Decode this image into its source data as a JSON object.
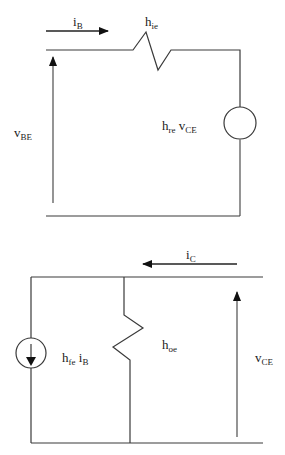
{
  "input_circuit": {
    "current_label": {
      "main": "i",
      "sub": "B"
    },
    "resistor_label": {
      "main": "h",
      "sub": "ie"
    },
    "voltage_label": {
      "main": "v",
      "sub": "BE"
    },
    "source_label": {
      "main1": "h",
      "sub1": "re",
      "main2": " v",
      "sub2": "CE"
    }
  },
  "output_circuit": {
    "current_label": {
      "main": "i",
      "sub": "C"
    },
    "source_label": {
      "main1": "h",
      "sub1": "fe",
      "main2": " i",
      "sub2": "B"
    },
    "resistor_label": {
      "main": "h",
      "sub": "oe"
    },
    "voltage_label": {
      "main": "v",
      "sub": "CE"
    }
  }
}
